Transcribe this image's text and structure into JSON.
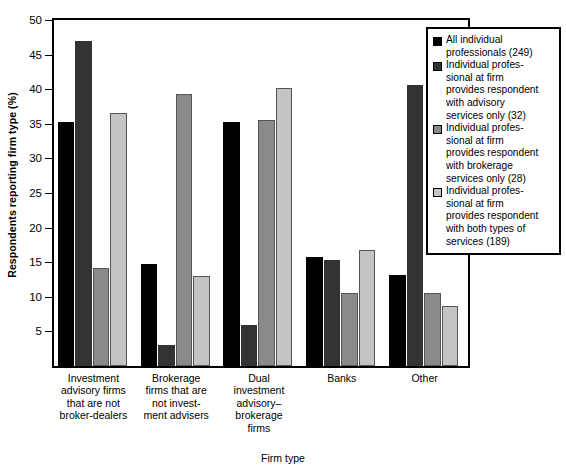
{
  "chart_data": {
    "type": "bar",
    "title": "",
    "xlabel": "Firm type",
    "ylabel": "Respondents reporting firm type (%)",
    "ylim": [
      0,
      50
    ],
    "yticks": [
      5,
      10,
      15,
      20,
      25,
      30,
      35,
      40,
      45,
      50
    ],
    "ytick_labels": [
      "5",
      "10",
      "15",
      "20",
      "25",
      "30",
      "35",
      "40",
      "45",
      "50"
    ],
    "grid": false,
    "legend_position": "top-right",
    "categories": [
      "Investment advisory firms that are not broker-dealers",
      "Brokerage firms that are not investment advisers",
      "Dual investment advisory–brokerage firms",
      "Banks",
      "Other"
    ],
    "category_label_lines": [
      [
        "Investment",
        "advisory firms",
        "that are not",
        "broker-dealers"
      ],
      [
        "Brokerage",
        "firms that are",
        "not invest-",
        "ment advisers"
      ],
      [
        "Dual",
        "investment",
        "advisory–",
        "brokerage",
        "firms"
      ],
      [
        "Banks"
      ],
      [
        "Other"
      ]
    ],
    "series": [
      {
        "name": "All individual professionals (249)",
        "label_lines": [
          "All individual",
          "professionals (249)"
        ],
        "color": "#000000",
        "values": [
          35.3,
          14.8,
          35.3,
          15.8,
          13.1
        ]
      },
      {
        "name": "Individual professional at firm provides respondent with advisory services only (32)",
        "label_lines": [
          "Individual profes-",
          "sional at firm",
          "provides respondent",
          "with advisory",
          "services only (32)"
        ],
        "color": "#333333",
        "values": [
          46.9,
          3.1,
          5.9,
          15.3,
          40.6
        ]
      },
      {
        "name": "Individual professional at firm provides respondent with brokerage services only (28)",
        "label_lines": [
          "Individual profes-",
          "sional at firm",
          "provides respondent",
          "with brokerage",
          "services only (28)"
        ],
        "color": "#8a8a8a",
        "values": [
          14.1,
          39.3,
          35.6,
          10.5,
          10.5
        ]
      },
      {
        "name": "Individual professional at firm provides respondent with both types of services (189)",
        "label_lines": [
          "Individual profes-",
          "sional at firm",
          "provides respondent",
          "with both types of",
          "services (189)"
        ],
        "color": "#c4c4c4",
        "values": [
          36.5,
          13.0,
          40.2,
          16.7,
          8.7
        ]
      }
    ]
  },
  "axis": {
    "y_title": "Respondents reporting firm type (%)",
    "x_title": "Firm type"
  },
  "colors": {
    "series_1": "#000000",
    "series_2": "#333333",
    "series_3": "#8a8a8a",
    "series_4": "#c4c4c4",
    "frame": "#000000",
    "background": "#ffffff"
  }
}
